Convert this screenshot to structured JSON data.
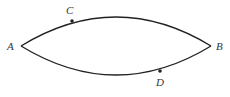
{
  "diagram": {
    "type": "closed curve with two arcs",
    "points": [
      {
        "id": "A",
        "label": "A",
        "x": 21,
        "y": 46,
        "label_x": 7,
        "label_y": 50
      },
      {
        "id": "B",
        "label": "B",
        "x": 211,
        "y": 46,
        "label_x": 216,
        "label_y": 50
      },
      {
        "id": "C",
        "label": "C",
        "x": 72,
        "y": 21,
        "label_x": 66,
        "label_y": 14
      },
      {
        "id": "D",
        "label": "D",
        "x": 160,
        "y": 71,
        "label_x": 156,
        "label_y": 86
      }
    ],
    "colors": {
      "stroke": "#222222",
      "label": "#333333",
      "background": "#ffffff"
    }
  }
}
